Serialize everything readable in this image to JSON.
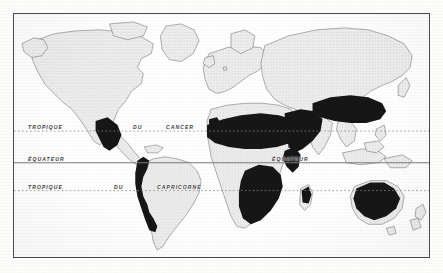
{
  "figure": {
    "kind": "world-map",
    "projection_note": "equirectangular world map, vintage French print"
  },
  "colors": {
    "frame_border": "#4a4a4a",
    "ocean": "#ffffff",
    "land_fill": "#e9e9e9",
    "land_stipple": "#9a9a9a",
    "coastline": "#6e6e6e",
    "highlight_region": "#141414",
    "latitude_line": "#8a8a8a",
    "equator_line": "#7a7a7a",
    "label_text": "#3c3c3c",
    "page_background": "#fdfdfc"
  },
  "latitude_lines": [
    {
      "id": "tropic-of-cancer",
      "label": "TROPIQUE    DU    CANCER",
      "label_left": "TROPIQUE",
      "label_mid": "DU",
      "label_right": "CANCER",
      "style": "dotted",
      "y_px": 131
    },
    {
      "id": "equator",
      "label": "ÉQUATEUR",
      "label_west": "ÉQUATEUR",
      "label_east": "ÉQUATEUR",
      "style": "solid",
      "y_px": 163
    },
    {
      "id": "tropic-of-capricorn",
      "label": "TROPIQUE    DU    CAPRICORNE",
      "label_left": "TROPIQUE",
      "label_mid": "DU",
      "label_right": "CAPRICORNE",
      "style": "dotted",
      "y_px": 191
    }
  ],
  "highlighted_regions": [
    {
      "name": "southwestern-north-america",
      "label": "Mexique / Sud-Ouest"
    },
    {
      "name": "andes-south-america",
      "label": "Andes"
    },
    {
      "name": "iberian-peninsula",
      "label": "Espagne"
    },
    {
      "name": "north-africa-sahara",
      "label": "Sahara"
    },
    {
      "name": "arabian-peninsula-middle-east",
      "label": "Arabie"
    },
    {
      "name": "central-asia",
      "label": "Asie centrale"
    },
    {
      "name": "horn-of-africa",
      "label": "Corne de l'Afrique"
    },
    {
      "name": "southern-africa-kalahari",
      "label": "Kalahari"
    },
    {
      "name": "madagascar-southwest",
      "label": "Madagascar"
    },
    {
      "name": "australia-interior",
      "label": "Australie"
    }
  ]
}
